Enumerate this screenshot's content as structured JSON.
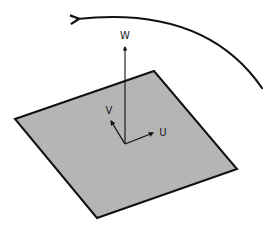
{
  "diagram": {
    "colors": {
      "background": "#ffffff",
      "plane_fill": "#b5b5b5",
      "stroke": "#111111"
    },
    "plane": {
      "vertices": [
        [
          15,
          119
        ],
        [
          154,
          71
        ],
        [
          237,
          169
        ],
        [
          97,
          218
        ]
      ]
    },
    "origin": [
      125,
      144
    ],
    "axes": [
      {
        "label": "W",
        "tip": [
          125,
          47
        ],
        "label_pos": [
          125,
          39
        ]
      },
      {
        "label": "V",
        "tip": [
          111,
          121
        ],
        "label_pos": [
          109,
          114
        ]
      },
      {
        "label": "U",
        "tip": [
          153,
          133
        ],
        "label_pos": [
          163,
          136
        ]
      }
    ],
    "rotation_arrow": {
      "start": [
        262,
        88
      ],
      "control": [
        205,
        5
      ],
      "end": [
        77,
        19
      ],
      "direction": "counter-clockwise"
    }
  }
}
